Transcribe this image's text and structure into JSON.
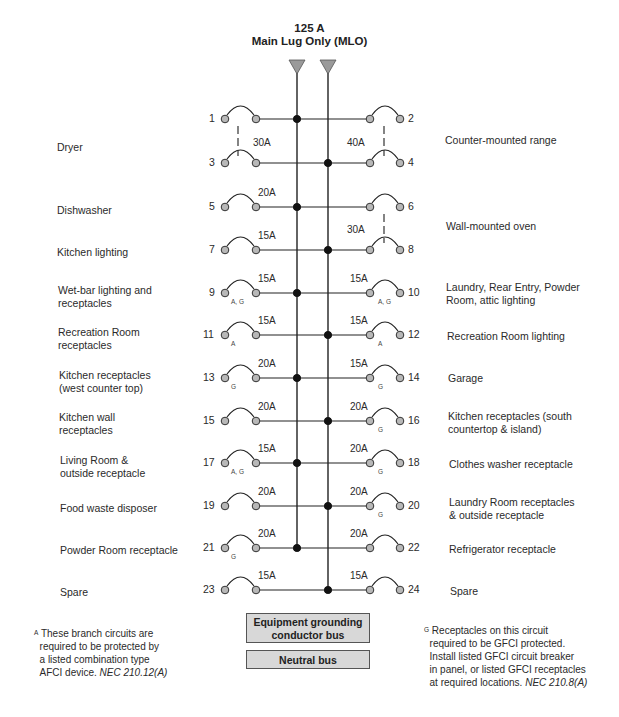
{
  "header": {
    "rating": "125 A",
    "type": "Main Lug Only (MLO)"
  },
  "colors": {
    "line": "#222222",
    "terminal_fill": "#b8b8b8",
    "lug_fill": "#9a9a9a",
    "bus_box_fill": "#d8d8d8"
  },
  "circuits_left": [
    {
      "num": "1",
      "label": "Dryer",
      "amp": "30A",
      "tags": "",
      "bus": "A"
    },
    {
      "num": "3",
      "label": "",
      "amp": "",
      "tags": "",
      "bus": "B"
    },
    {
      "num": "5",
      "label": "Dishwasher",
      "amp": "20A",
      "tags": "",
      "bus": "A"
    },
    {
      "num": "7",
      "label": "Kitchen lighting",
      "amp": "15A",
      "tags": "",
      "bus": "B"
    },
    {
      "num": "9",
      "label": "Wet-bar lighting and receptacles",
      "amp": "15A",
      "tags": "A, G",
      "bus": "A"
    },
    {
      "num": "11",
      "label": "Recreation Room receptacles",
      "amp": "15A",
      "tags": "A",
      "bus": "B"
    },
    {
      "num": "13",
      "label": "Kitchen receptacles (west counter top)",
      "amp": "20A",
      "tags": "G",
      "bus": "A"
    },
    {
      "num": "15",
      "label": "Kitchen wall receptacles",
      "amp": "20A",
      "tags": "",
      "bus": "B"
    },
    {
      "num": "17",
      "label": "Living Room & outside receptacle",
      "amp": "15A",
      "tags": "A, G",
      "bus": "A"
    },
    {
      "num": "19",
      "label": "Food waste disposer",
      "amp": "20A",
      "tags": "",
      "bus": "B"
    },
    {
      "num": "21",
      "label": "Powder Room receptacle",
      "amp": "20A",
      "tags": "G",
      "bus": "A"
    },
    {
      "num": "23",
      "label": "Spare",
      "amp": "15A",
      "tags": "",
      "bus": "B"
    }
  ],
  "circuits_right": [
    {
      "num": "2",
      "label": "Counter-mounted range",
      "amp": "40A",
      "tags": "",
      "bus": "A"
    },
    {
      "num": "4",
      "label": "",
      "amp": "",
      "tags": "",
      "bus": "B"
    },
    {
      "num": "6",
      "label": "Wall-mounted oven",
      "amp": "30A",
      "tags": "",
      "bus": "A"
    },
    {
      "num": "8",
      "label": "",
      "amp": "",
      "tags": "",
      "bus": "B"
    },
    {
      "num": "10",
      "label": "Laundry, Rear Entry, Powder Room, attic lighting",
      "amp": "15A",
      "tags": "A, G",
      "bus": "A"
    },
    {
      "num": "12",
      "label": "Recreation Room lighting",
      "amp": "15A",
      "tags": "A",
      "bus": "B"
    },
    {
      "num": "14",
      "label": "Garage",
      "amp": "15A",
      "tags": "G",
      "bus": "A"
    },
    {
      "num": "16",
      "label": "Kitchen receptacles (south countertop & island)",
      "amp": "20A",
      "tags": "G",
      "bus": "B"
    },
    {
      "num": "18",
      "label": "Clothes washer receptacle",
      "amp": "20A",
      "tags": "G",
      "bus": "A"
    },
    {
      "num": "20",
      "label": "Laundry Room receptacles & outside receptacle",
      "amp": "20A",
      "tags": "G",
      "bus": "B"
    },
    {
      "num": "22",
      "label": "Refrigerator receptacle",
      "amp": "20A",
      "tags": "",
      "bus": "A"
    },
    {
      "num": "24",
      "label": "Spare",
      "amp": "15A",
      "tags": "",
      "bus": "B"
    }
  ],
  "labels": {
    "dryer": "Dryer",
    "dishwasher": "Dishwasher",
    "kitchen_lighting": "Kitchen lighting",
    "wetbar_1": "Wet-bar lighting and",
    "wetbar_2": "receptacles",
    "recroom_rec_1": "Recreation Room",
    "recroom_rec_2": "receptacles",
    "kitchen_west_1": "Kitchen receptacles",
    "kitchen_west_2": "(west counter top)",
    "kitchen_wall_1": "Kitchen wall",
    "kitchen_wall_2": "receptacles",
    "living_1": "Living Room &",
    "living_2": "outside receptacle",
    "disposer": "Food waste disposer",
    "powder_rec": "Powder Room receptacle",
    "spare_left": "Spare",
    "range": "Counter-mounted range",
    "oven": "Wall-mounted oven",
    "laundry_light_1": "Laundry, Rear Entry, Powder",
    "laundry_light_2": "Room, attic lighting",
    "recroom_light": "Recreation Room lighting",
    "garage": "Garage",
    "kitchen_south_1": "Kitchen receptacles (south",
    "kitchen_south_2": "countertop & island)",
    "washer": "Clothes washer receptacle",
    "laundry_rec_1": "Laundry Room receptacles",
    "laundry_rec_2": "& outside receptacle",
    "fridge": "Refrigerator receptacle",
    "spare_right": "Spare"
  },
  "buses": {
    "ground": [
      "Equipment grounding",
      "conductor bus"
    ],
    "neutral": "Neutral bus"
  },
  "notes": {
    "afci": {
      "marker": "A",
      "lines": [
        "These branch circuits are",
        "required to be protected by",
        "a listed combination type",
        "AFCI device."
      ],
      "ref": "NEC 210.12(A)"
    },
    "gfci": {
      "marker": "G",
      "lines": [
        "Receptacles on this circuit",
        "required to be GFCI protected.",
        "Install listed GFCI circuit breaker",
        "in panel, or listed GFCI receptacles",
        "at required locations."
      ],
      "ref": "NEC 210.8(A)"
    }
  }
}
